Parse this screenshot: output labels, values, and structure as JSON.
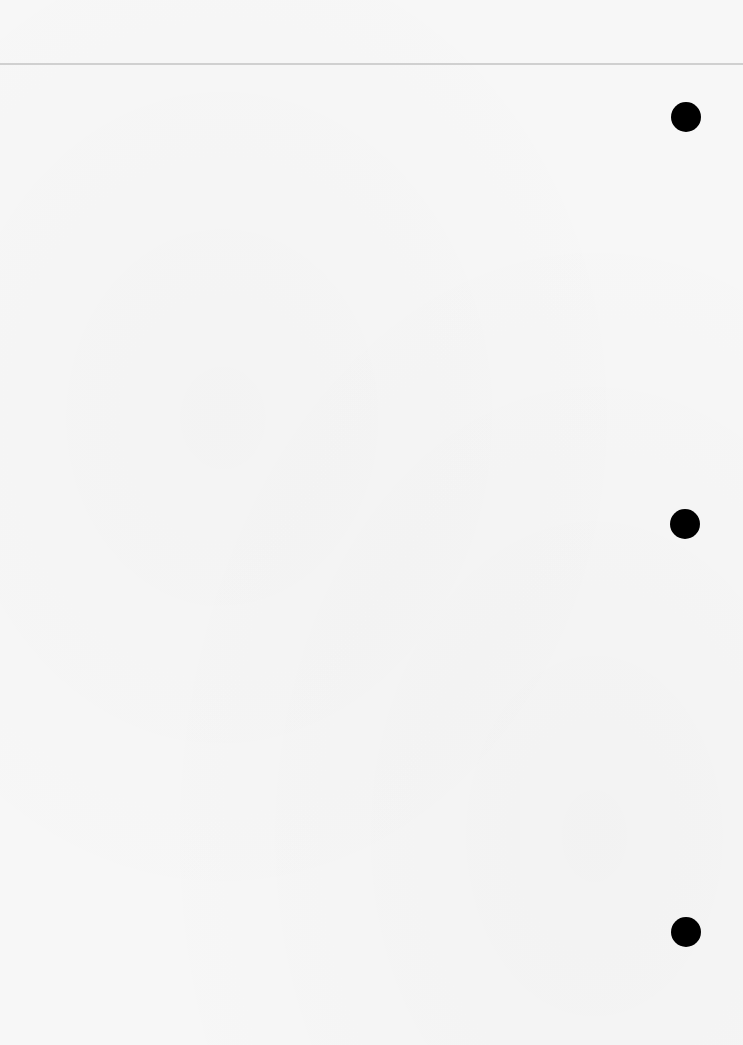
{
  "page": {
    "type": "blank-notepad-page",
    "background": "#f7f7f7",
    "header_rule_color": "#d0d0d0",
    "punch_hole_color": "#000000",
    "punch_holes": [
      {
        "cx": 686,
        "cy": 117
      },
      {
        "cx": 685,
        "cy": 524
      },
      {
        "cx": 686,
        "cy": 932
      }
    ]
  }
}
